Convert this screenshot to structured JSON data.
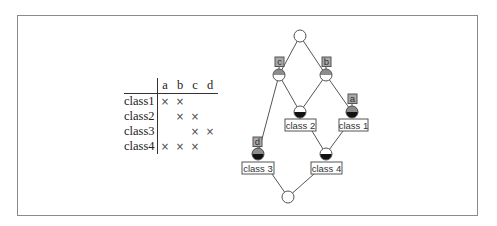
{
  "context_table": {
    "attributes": [
      "a",
      "b",
      "c",
      "d"
    ],
    "objects": [
      {
        "name": "class1",
        "cells": [
          "×",
          "×",
          "",
          ""
        ]
      },
      {
        "name": "class2",
        "cells": [
          "",
          "×",
          "×",
          ""
        ]
      },
      {
        "name": "class3",
        "cells": [
          "",
          "",
          "×",
          "×"
        ]
      },
      {
        "name": "class4",
        "cells": [
          "×",
          "×",
          "×",
          ""
        ]
      }
    ]
  },
  "lattice": {
    "attribute_labels": {
      "c": "c",
      "b": "b",
      "a": "a",
      "d": "d"
    },
    "object_labels": {
      "class1": "class 1",
      "class2": "class 2",
      "class3": "class 3",
      "class4": "class 4"
    },
    "colors": {
      "attr_label_fill": "#a8a8a8",
      "attr_half": "#8c8c8c",
      "obj_half": "#111111",
      "edge": "#555555"
    }
  }
}
